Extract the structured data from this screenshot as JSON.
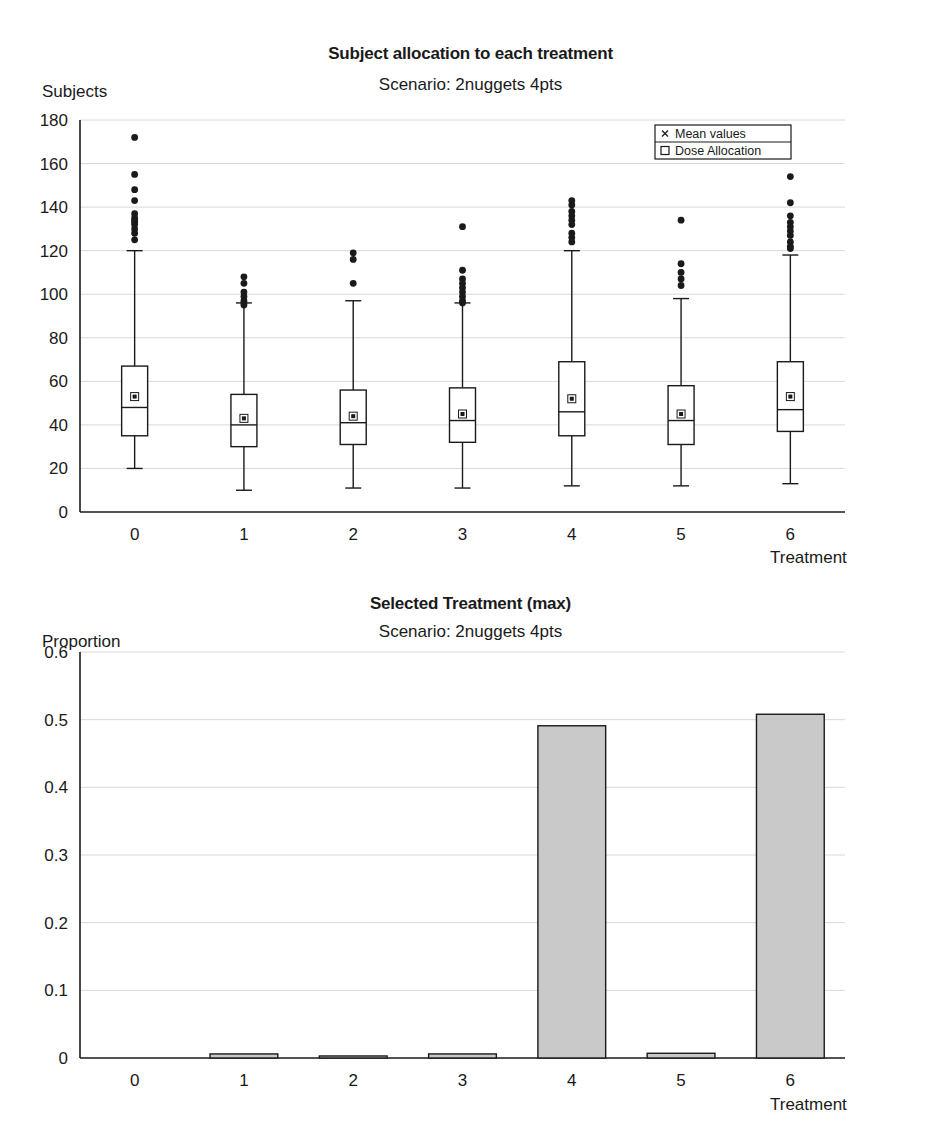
{
  "figure": {
    "background": "#ffffff",
    "ink": "#1a1a1a",
    "grid_color": "#d8d8d8",
    "bar_fill": "#c9c9c9",
    "bar_stroke": "#1a1a1a"
  },
  "top": {
    "title": "Subject allocation to each treatment",
    "subtitle": "Scenario: 2nuggets 4pts",
    "ylabel": "Subjects",
    "xlabel": "Treatment",
    "legend": [
      {
        "label": "Mean values",
        "marker": "cross-marker"
      },
      {
        "label": "Dose Allocation",
        "marker": "square-marker"
      }
    ]
  },
  "bottom": {
    "title": "Selected Treatment (max)",
    "subtitle": "Scenario: 2nuggets 4pts",
    "ylabel": "Proportion",
    "xlabel": "Treatment"
  },
  "chart_data": [
    {
      "id": "subject-allocation-boxplot",
      "type": "box",
      "title": "Subject allocation to each treatment",
      "subtitle": "Scenario: 2nuggets 4pts",
      "xlabel": "Treatment",
      "ylabel": "Subjects",
      "categories": [
        "0",
        "1",
        "2",
        "3",
        "4",
        "5",
        "6"
      ],
      "ylim": [
        0,
        180
      ],
      "yticks": [
        0,
        20,
        40,
        60,
        80,
        100,
        120,
        140,
        160,
        180
      ],
      "grid": true,
      "legend_position": "top-right",
      "legend": [
        "Mean values",
        "Dose Allocation"
      ],
      "boxes": [
        {
          "category": "0",
          "whisker_low": 20,
          "q1": 35,
          "median": 48,
          "q3": 67,
          "whisker_high": 120,
          "mean": 53,
          "outliers": [
            172,
            155,
            148,
            143,
            137,
            135,
            134,
            133,
            132,
            130,
            128,
            125
          ]
        },
        {
          "category": "1",
          "whisker_low": 10,
          "q1": 30,
          "median": 40,
          "q3": 54,
          "whisker_high": 96,
          "mean": 43,
          "outliers": [
            108,
            105,
            101,
            99,
            97,
            96,
            95
          ]
        },
        {
          "category": "2",
          "whisker_low": 11,
          "q1": 31,
          "median": 41,
          "q3": 56,
          "whisker_high": 97,
          "mean": 44,
          "outliers": [
            119,
            116,
            105
          ]
        },
        {
          "category": "3",
          "whisker_low": 11,
          "q1": 32,
          "median": 42,
          "q3": 57,
          "whisker_high": 96,
          "mean": 45,
          "outliers": [
            131,
            111,
            107,
            105,
            103,
            101,
            99,
            97,
            96
          ]
        },
        {
          "category": "4",
          "whisker_low": 12,
          "q1": 35,
          "median": 46,
          "q3": 69,
          "whisker_high": 120,
          "mean": 52,
          "outliers": [
            143,
            141,
            138,
            136,
            134,
            132,
            128,
            126,
            124
          ]
        },
        {
          "category": "5",
          "whisker_low": 12,
          "q1": 31,
          "median": 42,
          "q3": 58,
          "whisker_high": 98,
          "mean": 45,
          "outliers": [
            134,
            114,
            110,
            107,
            104
          ]
        },
        {
          "category": "6",
          "whisker_low": 13,
          "q1": 37,
          "median": 47,
          "q3": 69,
          "whisker_high": 118,
          "mean": 53,
          "outliers": [
            154,
            142,
            136,
            133,
            131,
            129,
            127,
            124,
            122,
            121
          ]
        }
      ]
    },
    {
      "id": "selected-treatment-bar",
      "type": "bar",
      "title": "Selected Treatment (max)",
      "subtitle": "Scenario: 2nuggets 4pts",
      "xlabel": "Treatment",
      "ylabel": "Proportion",
      "categories": [
        "0",
        "1",
        "2",
        "3",
        "4",
        "5",
        "6"
      ],
      "values": [
        0.0,
        0.006,
        0.003,
        0.006,
        0.491,
        0.007,
        0.508
      ],
      "ylim": [
        0,
        0.6
      ],
      "yticks": [
        "0",
        "0.1",
        "0.2",
        "0.3",
        "0.4",
        "0.5",
        "0.6"
      ],
      "ytick_values": [
        0,
        0.1,
        0.2,
        0.3,
        0.4,
        0.5,
        0.6
      ],
      "grid": true
    }
  ]
}
